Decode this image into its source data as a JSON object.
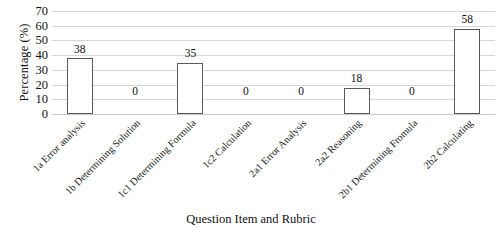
{
  "chart_data": {
    "type": "bar",
    "title": "",
    "xlabel": "Question Item and Rubric",
    "ylabel": "Percentage (%)",
    "ylim": [
      0,
      70
    ],
    "ytick_step": 10,
    "yticks": [
      70,
      60,
      50,
      40,
      30,
      20,
      10,
      0
    ],
    "grid": "horizontal",
    "legend": "none",
    "bar_fill_color": "#ffffff",
    "bar_border_color": "#595959",
    "gridline_color": "#d6d6d6",
    "show_data_labels": true,
    "categories": [
      "1a Error analysis",
      "1b Determining Solution",
      "1c1 Determining Formula",
      "1c2 Calculation",
      "2a1 Error Analysis",
      "2a2 Reasoning",
      "2b1 Determining Fromula",
      "2b2 Calculating"
    ],
    "values": [
      38,
      0,
      35,
      0,
      0,
      18,
      0,
      58
    ],
    "data_labels": [
      "38",
      "0",
      "35",
      "0",
      "0",
      "18",
      "0",
      "58"
    ]
  }
}
